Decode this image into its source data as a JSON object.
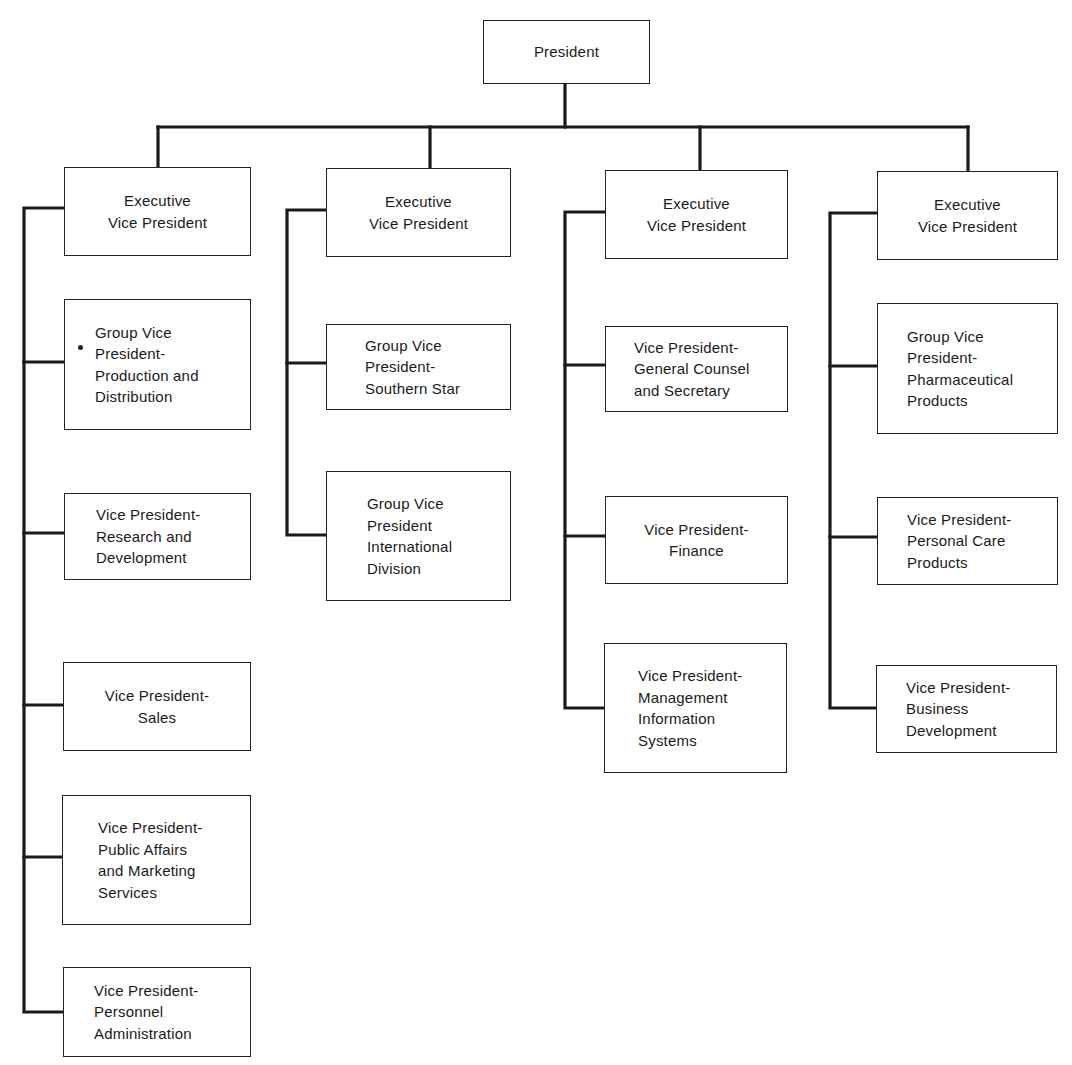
{
  "chart": {
    "top": {
      "id": "president",
      "label": "President"
    },
    "columns": [
      {
        "executive": {
          "label": "Executive\nVice President"
        },
        "reports": [
          {
            "label": "Group Vice\nPresident-\nProduction and\nDistribution"
          },
          {
            "label": "Vice President-\nResearch and\nDevelopment"
          },
          {
            "label": "Vice President-\nSales"
          },
          {
            "label": "Vice President-\nPublic Affairs\nand Marketing\nServices"
          },
          {
            "label": "Vice President-\nPersonnel\nAdministration"
          }
        ]
      },
      {
        "executive": {
          "label": "Executive\nVice President"
        },
        "reports": [
          {
            "label": "Group Vice\nPresident-\nSouthern Star"
          },
          {
            "label": "Group Vice\nPresident\nInternational\nDivision"
          }
        ]
      },
      {
        "executive": {
          "label": "Executive\nVice President"
        },
        "reports": [
          {
            "label": "Vice President-\nGeneral Counsel\nand Secretary"
          },
          {
            "label": "Vice President-\nFinance"
          },
          {
            "label": "Vice President-\nManagement\nInformation\nSystems"
          }
        ]
      },
      {
        "executive": {
          "label": "Executive\nVice President"
        },
        "reports": [
          {
            "label": "Group Vice\nPresident-\nPharmaceutical\nProducts"
          },
          {
            "label": "Vice President-\nPersonal Care\nProducts"
          },
          {
            "label": "Vice President-\nBusiness\nDevelopment"
          }
        ]
      }
    ]
  },
  "colors": {
    "line": "#1a1a1a",
    "box_border": "#222222",
    "background": "#ffffff"
  }
}
